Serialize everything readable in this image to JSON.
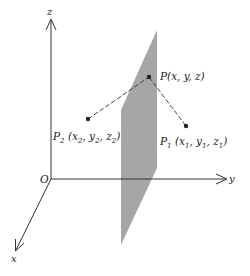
{
  "figure": {
    "type": "3d-coordinate-diagram"
  },
  "colors": {
    "axis": "#333333",
    "plane_fill": "#a6a6a6",
    "dash_line": "#333333",
    "point": "#222222",
    "text": "#222222"
  },
  "axes": {
    "origin_label": "O",
    "x_label": "x",
    "y_label": "y",
    "z_label": "z"
  },
  "points": {
    "p": {
      "name": "P",
      "coords_text": "(x, y, z)"
    },
    "p1": {
      "name": "P",
      "subscript": "1",
      "open": " (x",
      "x_sub": "1",
      "mid1": ", y",
      "y_sub": "1",
      "mid2": ", z",
      "z_sub": "1",
      "close": ")"
    },
    "p2": {
      "name": "P",
      "subscript": "2",
      "open": " (x",
      "x_sub": "2",
      "mid1": ", y",
      "y_sub": "2",
      "mid2": ", z",
      "z_sub": "2",
      "close": ")"
    }
  },
  "plane": {
    "label": "perpendicular-bisector-plane"
  }
}
